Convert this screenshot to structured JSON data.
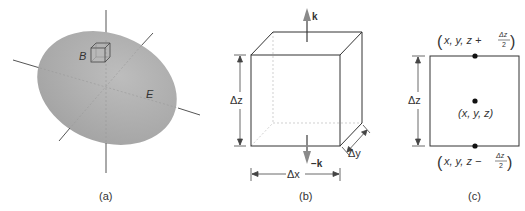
{
  "panels": {
    "a": {
      "caption": "(a)",
      "box_label": "B",
      "surface_label": "E"
    },
    "b": {
      "caption": "(b)",
      "up_vector": "k",
      "down_vector": "−k",
      "dim_z": "Δz",
      "dim_x": "Δx",
      "dim_y": "Δy"
    },
    "c": {
      "caption": "(c)",
      "dim_z": "Δz",
      "top_point": {
        "prefix": "x, y, z + ",
        "frac_num": "Δz",
        "frac_den": "2"
      },
      "center_point": "(x, y, z)",
      "bottom_point": {
        "prefix": "x, y, z − ",
        "frac_num": "Δz",
        "frac_den": "2"
      }
    }
  },
  "colors": {
    "ellipse_fill": "#a9a9a9",
    "line": "#444444",
    "arrow": "#8a8a8a",
    "text": "#333333"
  }
}
